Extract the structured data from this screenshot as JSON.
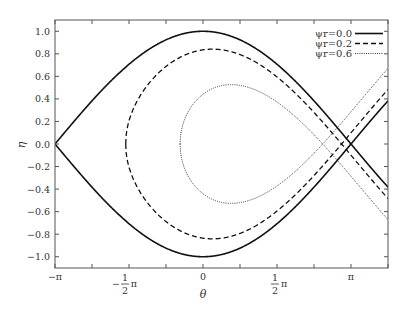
{
  "chart_data": {
    "type": "line",
    "title": "",
    "xlabel": "θ",
    "ylabel": "η",
    "xlim": [
      -3.14159,
      3.92699
    ],
    "ylim": [
      -1.1,
      1.1
    ],
    "grid": false,
    "legend_position": "upper right",
    "x_ticks": [
      {
        "value": -3.14159,
        "label": "−π"
      },
      {
        "value": -1.5708,
        "label": "−½π"
      },
      {
        "value": 0,
        "label": "0"
      },
      {
        "value": 1.5708,
        "label": "½π"
      },
      {
        "value": 3.14159,
        "label": "π"
      }
    ],
    "y_ticks": [
      "1.0",
      "0.8",
      "0.6",
      "0.4",
      "0.2",
      "0.0",
      "-0.2",
      "-0.4",
      "-0.6",
      "-0.8",
      "-1.0"
    ],
    "model": "separatrix: η = ±sqrt(½cosψ − ½sinψ(π−ψ) + ½cosθ + ½sinψ·θ)",
    "series": [
      {
        "name": "ψr=0.0",
        "psi": 0.0,
        "style": "solid",
        "peak_eta": 1.0,
        "peak_theta": 0.0,
        "left_turn_theta": -3.1416,
        "x_point_theta": 3.1416
      },
      {
        "name": "ψr=0.2",
        "psi": 0.2,
        "style": "dashed",
        "peak_eta": 0.84,
        "peak_theta": 0.2,
        "left_turn_theta": -1.64,
        "x_point_theta": 2.94
      },
      {
        "name": "ψr=0.6",
        "psi": 0.6,
        "style": "dotted",
        "peak_eta": 0.53,
        "peak_theta": 0.6,
        "left_turn_theta": -0.47,
        "x_point_theta": 2.54
      }
    ]
  },
  "labels": {
    "xlabel": "θ",
    "ylabel": "η",
    "legend": [
      "ψr=0.0",
      "ψr=0.2",
      "ψr=0.6"
    ]
  }
}
